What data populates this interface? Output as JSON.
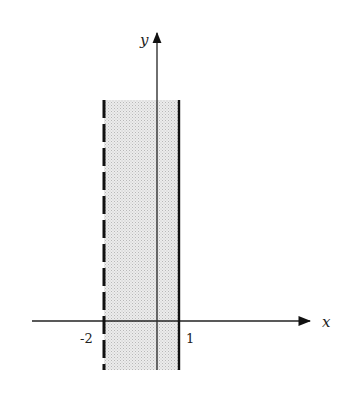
{
  "diagram": {
    "type": "coordinate-plane-region",
    "axes": {
      "x_label": "x",
      "y_label": "y"
    },
    "tick_labels": {
      "left": "-2",
      "right": "1"
    },
    "boundaries": [
      {
        "x": -2,
        "style": "dashed",
        "included": false
      },
      {
        "x": 1,
        "style": "solid",
        "included": true
      }
    ],
    "region": {
      "inequality": "-2 < x ≤ 1",
      "fill": "#d9d9d9"
    },
    "colors": {
      "line": "#111111",
      "axis": "#222222",
      "shade": "#d6d6d6"
    }
  }
}
